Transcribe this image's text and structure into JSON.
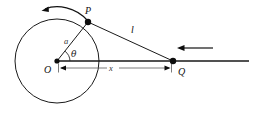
{
  "figure": {
    "background_color": "#ffffff",
    "line_color": "#1a1a1a",
    "dimension_color": "#5a5a5a"
  },
  "labels": {
    "center": "O",
    "circle_point": "P",
    "axis_point": "Q",
    "radius": "a",
    "angle": "θ",
    "chord": "l",
    "distance": "x"
  },
  "geometry": {
    "circle": {
      "cx": 57,
      "cy": 61,
      "r": 42
    },
    "points": {
      "O": {
        "x": 57,
        "y": 61
      },
      "P": {
        "x": 88,
        "y": 22
      },
      "Q": {
        "x": 173,
        "y": 61
      }
    },
    "axis_line": {
      "x1": 57,
      "y1": 61,
      "x2": 249,
      "y2": 61
    },
    "dimension_line": {
      "x1": 59,
      "y1": 68,
      "x2": 171,
      "y2": 68
    },
    "angle_arc_radius": 13
  },
  "arrows": {
    "rotation_arrow": {
      "name": "counterclockwise-rotation-arrow",
      "direction": "left",
      "from_x": 88,
      "to_x": 42,
      "apex_y": 8
    },
    "velocity_arrow": {
      "name": "leftward-velocity-arrow",
      "direction": "left",
      "from_x": 213,
      "to_x": 178,
      "y": 48
    }
  },
  "label_positions": {
    "O": {
      "x": 44,
      "y": 73
    },
    "P": {
      "x": 85,
      "y": 14
    },
    "Q": {
      "x": 178,
      "y": 75
    },
    "a": {
      "x": 64,
      "y": 44
    },
    "theta": {
      "x": 71,
      "y": 57
    },
    "l": {
      "x": 131,
      "y": 33
    },
    "x": {
      "x": 112,
      "y": 71
    }
  }
}
